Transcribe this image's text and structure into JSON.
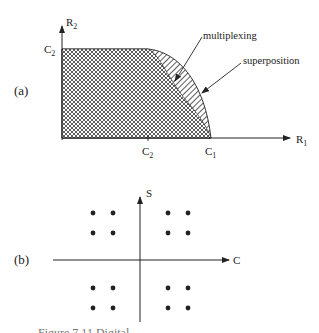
{
  "panel_a": {
    "label": "(a)",
    "y_axis_label": "R",
    "y_axis_sub": "2",
    "x_axis_label": "R",
    "x_axis_sub": "1",
    "y_tick_label": "C",
    "y_tick_sub": "2",
    "x_tick1_label": "C",
    "x_tick1_sub": "2",
    "x_tick2_label": "C",
    "x_tick2_sub": "1",
    "region_inner_label": "multiplexing",
    "region_outer_label": "superposition",
    "colors": {
      "line": "#222222",
      "fill_hatch": "#333333"
    }
  },
  "panel_b": {
    "label": "(b)",
    "y_axis_label": "S",
    "x_axis_label": "C",
    "constellation_points": 16
  },
  "caption": "Figure 7.11  Digital ..."
}
